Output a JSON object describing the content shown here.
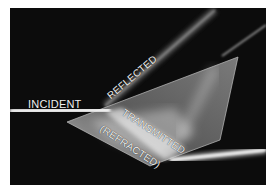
{
  "figure": {
    "labels": {
      "incident": "INCIDENT",
      "reflected": "REFLECTED",
      "transmitted": "TRANSMITTED",
      "refracted": "(REFRACTED)"
    },
    "colors": {
      "background": "#0c0c0c",
      "beam": "#e8e8e8",
      "prism": "#9a9a9a",
      "page": "#ffffff"
    }
  }
}
